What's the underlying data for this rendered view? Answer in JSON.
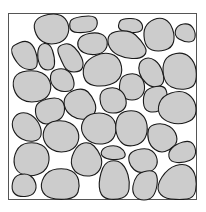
{
  "figure": {
    "frame": {
      "x": 8,
      "y": 13,
      "width": 189,
      "height": 187,
      "stroke": "#555555"
    },
    "particle_fill": "#cccccc",
    "particle_stroke": "#1a1a1a",
    "particle_count": 36,
    "particles": [
      "40,16 56,13 66,18 70,30 64,42 48,45 37,38 33,24",
      "72,18 92,15 98,20 96,30 84,33 71,32 69,24",
      "122,19 136,18 143,24 142,32 128,33 118,29 119,22",
      "148,22 160,17 170,22 175,36 172,48 158,52 146,48 143,32",
      "177,25 190,23 196,33 194,42 184,42 174,36",
      "14,45 26,40 34,46 38,60 36,70 22,69 13,57 11,49",
      "39,44 50,43 55,58 54,70 42,70 37,58",
      "60,45 70,43 79,52 84,63 81,72 67,72 61,60 57,50",
      "82,35 96,32 106,36 108,46 102,54 88,55 79,50 77,42",
      "110,32 130,30 141,40 148,52 140,59 124,58 112,52 107,42",
      "88,59 104,52 118,56 123,70 118,82 102,87 86,84 82,70",
      "141,60 150,57 160,64 165,80 160,87 150,87 141,78 138,68",
      "168,55 184,52 195,62 197,78 193,88 178,90 165,84 162,66",
      "18,72 36,70 48,76 52,88 46,100 28,103 16,96 12,82",
      "53,70 64,68 72,74 75,86 70,92 58,91 51,84 50,76",
      "124,75 136,73 144,80 145,92 138,100 126,100 119,92 120,80",
      "104,89 116,87 125,94 127,106 120,113 106,113 100,104 100,94",
      "148,88 164,85 168,95 165,108 154,113 144,110 143,96",
      "162,96 180,90 192,96 197,108 194,120 178,125 163,120 157,110",
      "42,100 58,97 65,104 64,116 56,122 44,125 36,118 35,106",
      "70,91 84,88 92,96 97,108 92,118 78,120 66,112 63,100",
      "16,114 26,112 36,118 42,130 40,140 28,142 16,136 11,124",
      "48,122 64,120 76,126 80,138 74,150 58,153 46,146 42,134",
      "86,115 102,112 114,118 117,130 112,142 98,145 86,140 80,128",
      "120,112 136,110 146,118 148,132 142,144 126,147 117,138 115,124",
      "150,125 164,123 175,130 178,142 170,150 160,153 150,146 147,134",
      "20,144 36,142 47,148 50,160 45,172 30,177 16,172 13,158",
      "78,144 90,142 98,150 103,162 98,174 86,177 74,172 70,160",
      "104,147 116,145 124,150 126,157 118,160 106,159 100,154",
      "134,150 148,148 156,154 158,164 152,172 138,173 130,166 128,156",
      "176,144 190,140 196,148 195,158 184,163 170,162 168,152",
      "14,176 26,173 34,178 37,188 32,196 18,197 11,190",
      "48,170 66,168 77,174 80,186 76,198 58,200 44,196 40,184",
      "104,162 118,160 126,168 130,182 128,196 116,200 102,198 98,184",
      "140,172 154,170 158,178 156,192 150,200 138,200 132,192 134,180",
      "168,168 184,163 194,170 197,184 194,198 180,200 162,198 156,186"
    ]
  }
}
